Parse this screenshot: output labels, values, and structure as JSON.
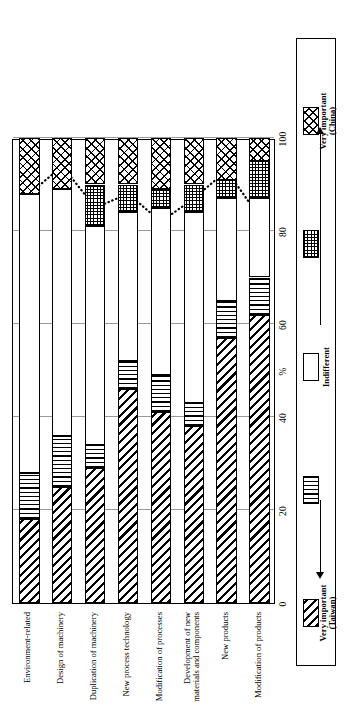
{
  "chart_data": {
    "type": "bar",
    "orientation": "horizontal-stacked",
    "title": "",
    "xlabel": "%",
    "ylabel": "",
    "xlim": [
      0,
      100
    ],
    "xticks": [
      0,
      20,
      40,
      60,
      80,
      100
    ],
    "xtick_labels": [
      "0",
      "20",
      "40",
      "60",
      "80",
      "100"
    ],
    "axis_unit_label": "%",
    "grid": true,
    "legend_position": "bottom",
    "categories": [
      "Environment-related",
      "Design of machinery",
      "Duplication of machinery",
      "New process technology",
      "Modification of processes",
      "Development of new\nmaterials and components",
      "New products",
      "Modification of products"
    ],
    "series": [
      {
        "name": "Very important (Taiwan)",
        "pattern": "diagonal-hatch",
        "values": [
          18,
          25,
          29,
          46,
          41,
          38,
          57,
          62
        ]
      },
      {
        "name": "Rather important",
        "pattern": "vertical-lines",
        "values": [
          10,
          11,
          5,
          6,
          8,
          5,
          8,
          8
        ]
      },
      {
        "name": "Indifferent",
        "pattern": "blank",
        "values": [
          60,
          53,
          47,
          32,
          36,
          41,
          22,
          17
        ]
      },
      {
        "name": "Less important",
        "pattern": "cross-dots",
        "values": [
          0,
          0,
          9,
          6,
          4,
          6,
          4,
          8
        ]
      },
      {
        "name": "Very important (China)",
        "pattern": "cross-diagonal",
        "values": [
          12,
          11,
          10,
          10,
          11,
          10,
          9,
          5
        ]
      }
    ],
    "line_series": {
      "name": "China cumulative marker line",
      "style": "dotted",
      "marker": "diamond",
      "values": [
        88,
        94,
        85,
        88,
        82,
        87,
        93,
        83
      ]
    },
    "legend_entries": [
      {
        "label": "Very important\n(Taiwan)",
        "pattern": "diagonal-hatch"
      },
      {
        "label": "",
        "pattern": "vertical-lines"
      },
      {
        "label": "Indifferent",
        "pattern": "blank"
      },
      {
        "label": "",
        "pattern": "cross-dots"
      },
      {
        "label": "Very important\n(China)",
        "pattern": "cross-diagonal"
      }
    ]
  }
}
